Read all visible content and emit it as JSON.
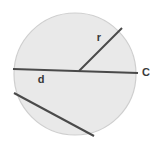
{
  "figure": {
    "type": "geometry-diagram",
    "background_color": "#ffffff",
    "circle": {
      "name": "circle",
      "center_x": 75,
      "center_y": 74,
      "radius": 61,
      "fill_color": "#e9e9e9",
      "stroke_color": "#cfcfcf",
      "stroke_width": 1.2
    },
    "lines": [
      {
        "name": "diameter-line",
        "label": "d",
        "x1": 13,
        "y1": 69,
        "x2": 138,
        "y2": 73,
        "stroke_color": "#4a4a4a",
        "stroke_width": 2.1
      },
      {
        "name": "radius-line",
        "label": "r",
        "x1": 79,
        "y1": 71,
        "x2": 122,
        "y2": 28,
        "stroke_color": "#4a4a4a",
        "stroke_width": 2.0
      },
      {
        "name": "chord-line",
        "label": "",
        "x1": 14,
        "y1": 93,
        "x2": 94,
        "y2": 136,
        "stroke_color": "#4a4a4a",
        "stroke_width": 2.0
      }
    ],
    "labels": [
      {
        "name": "radius-label",
        "text": "r",
        "x": 99,
        "y": 38,
        "color": "#3a3a3a",
        "font_size": 11
      },
      {
        "name": "diameter-label",
        "text": "d",
        "x": 41,
        "y": 80,
        "color": "#3a3a3a",
        "font_size": 11
      },
      {
        "name": "circumference-label",
        "text": "C",
        "x": 146,
        "y": 73,
        "color": "#3a3a3a",
        "font_size": 11
      }
    ]
  }
}
